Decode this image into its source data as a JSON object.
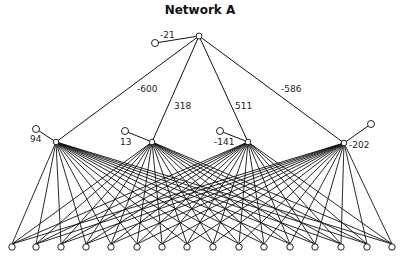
{
  "title": "Network A",
  "colors": {
    "line": "#111111",
    "node_fill": "#ffffff",
    "node_stroke": "#222222"
  },
  "output_node": {
    "x": 199,
    "y": 36,
    "bias": {
      "x": 155,
      "y": 43,
      "value": "-21",
      "label_x": 160,
      "label_y": 30
    }
  },
  "hidden_nodes": [
    {
      "x": 56,
      "y": 142,
      "weight_to_output": "-600",
      "weight_label_x": 137,
      "weight_label_y": 84,
      "bias": {
        "x": 36,
        "y": 129,
        "value": "94",
        "label_x": 30,
        "label_y": 134
      }
    },
    {
      "x": 152,
      "y": 142,
      "weight_to_output": "318",
      "weight_label_x": 174,
      "weight_label_y": 101,
      "bias": {
        "x": 125,
        "y": 131,
        "value": "13",
        "label_x": 120,
        "label_y": 137
      }
    },
    {
      "x": 248,
      "y": 142,
      "weight_to_output": "511",
      "weight_label_x": 235,
      "weight_label_y": 101,
      "bias": {
        "x": 220,
        "y": 131,
        "value": "-141",
        "label_x": 214,
        "label_y": 137
      }
    },
    {
      "x": 344,
      "y": 143,
      "weight_to_output": "-586",
      "weight_label_x": 281,
      "weight_label_y": 84,
      "bias": {
        "x": 371,
        "y": 124,
        "value": "-202",
        "label_x": 349,
        "label_y": 140
      }
    }
  ],
  "input_nodes": {
    "y": 247,
    "xs": [
      12,
      36,
      61,
      86,
      111,
      137,
      162,
      187,
      213,
      239,
      264,
      290,
      315,
      341,
      367,
      392
    ]
  }
}
